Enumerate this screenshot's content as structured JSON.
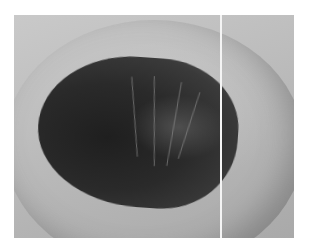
{
  "image": {
    "description": "Grayscale close-up photograph showing a dark oval lesion with fine wrinkle-like lines on lighter surrounding tissue, split by a thin white vertical line",
    "colors": {
      "background": "#ffffff",
      "tissue": "#bdbdbd",
      "lesion": "#2a2a2a",
      "divider": "#f4f4f4"
    }
  }
}
